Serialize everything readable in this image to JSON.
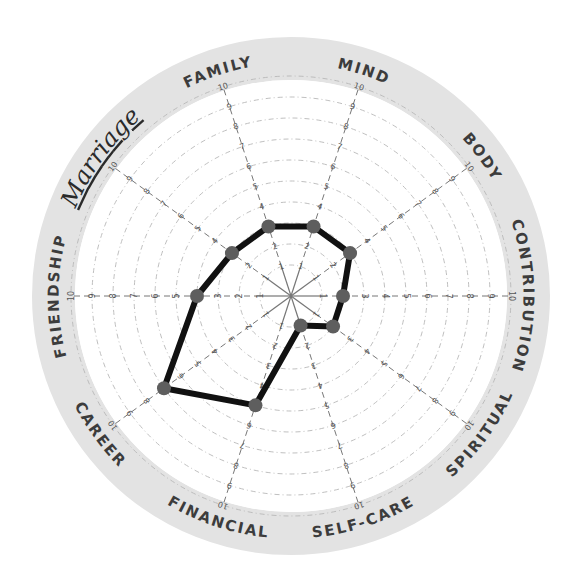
{
  "chart_data": {
    "type": "radar",
    "title": "",
    "subtitle": "",
    "annotation": "Marriage",
    "categories": [
      "Contribution",
      "Spiritual",
      "Self-Care",
      "Financial",
      "Career",
      "Friendship",
      "Marriage",
      "Family",
      "Mind",
      "Body"
    ],
    "display_labels": [
      "CONTRIBUTION",
      "SPIRITUAL",
      "SELF-CARE",
      "FINANCIAL",
      "CAREER",
      "FRIENDSHIP",
      "Marriage",
      "FAMILY",
      "MIND",
      "BODY"
    ],
    "angles_deg_clockwise_from_right": [
      0,
      36,
      72,
      108,
      144,
      180,
      216,
      252,
      288,
      324
    ],
    "series": [
      {
        "name": "Life balance",
        "values": [
          2,
          2,
          1,
          5,
          7,
          4,
          3,
          3,
          3,
          3
        ]
      }
    ],
    "scale": {
      "min": 0,
      "max": 10,
      "ticks": [
        1,
        2,
        3,
        4,
        5,
        6,
        7,
        8,
        9,
        10
      ]
    },
    "grid": "concentric dashed circles",
    "legend": "none"
  },
  "colors": {
    "ring_band": "#e3e3e3",
    "grid": "#b8b8b8",
    "spoke": "#777777",
    "line": "#111111",
    "dot": "#5e5e5e",
    "label": "#3c3c3c"
  },
  "geometry": {
    "cx": 291,
    "cy": 296,
    "ring_outer": 259,
    "ring_inner": 216,
    "r0": 10,
    "unit": 21
  }
}
